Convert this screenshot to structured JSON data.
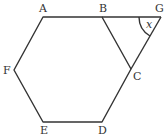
{
  "diagram": {
    "type": "geometry",
    "points": {
      "A": {
        "label": "A",
        "x": 43,
        "y": 17
      },
      "B": {
        "label": "B",
        "x": 102,
        "y": 17
      },
      "C": {
        "label": "C",
        "x": 131,
        "y": 68
      },
      "D": {
        "label": "D",
        "x": 102,
        "y": 122
      },
      "E": {
        "label": "E",
        "x": 43,
        "y": 122
      },
      "F": {
        "label": "F",
        "x": 14,
        "y": 70
      },
      "G": {
        "label": "G",
        "x": 161,
        "y": 17
      }
    },
    "angle_label": "x",
    "stroke_color": "#333333"
  }
}
